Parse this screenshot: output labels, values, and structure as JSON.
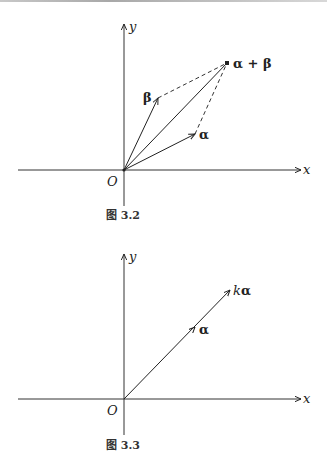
{
  "figures": [
    {
      "caption": "图 3.2",
      "axes": {
        "x_label": "x",
        "y_label": "y",
        "origin_label": "O"
      },
      "vectors": [
        {
          "name": "alpha",
          "label": "α",
          "from": [
            0,
            0
          ],
          "to": [
            71,
            36
          ]
        },
        {
          "name": "beta",
          "label": "β",
          "from": [
            0,
            0
          ],
          "to": [
            34,
            72
          ]
        },
        {
          "name": "alpha-plus-beta",
          "label": "α + β",
          "from": [
            0,
            0
          ],
          "to": [
            103,
            107
          ]
        }
      ],
      "dashed_lines": [
        {
          "from": "beta",
          "to": "alpha-plus-beta"
        },
        {
          "from": "alpha",
          "to": "alpha-plus-beta"
        }
      ]
    },
    {
      "caption": "图 3.3",
      "axes": {
        "x_label": "x",
        "y_label": "y",
        "origin_label": "O"
      },
      "vectors": [
        {
          "name": "alpha",
          "label": "α",
          "from": [
            0,
            0
          ],
          "to": [
            71,
            71
          ]
        },
        {
          "name": "k-alpha",
          "label": "kα",
          "from": [
            0,
            0
          ],
          "to": [
            106,
            109
          ]
        }
      ],
      "labels": {
        "k": "k",
        "alpha": "α"
      }
    }
  ]
}
